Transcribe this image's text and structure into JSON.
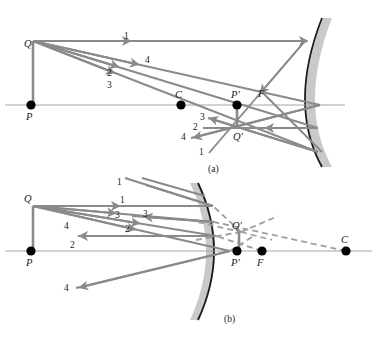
{
  "figure": {
    "colors": {
      "ray": "#8a8a8a",
      "axis": "#9a9a9a",
      "mirror_line": "#1a1a1a",
      "mirror_shade": "#c9c9c9",
      "point": "#000000",
      "label": "#1a1a1a",
      "virtual_ray": "#9e9e9e",
      "background": "#ffffff"
    },
    "panels": [
      {
        "id": "a",
        "caption": "(a)",
        "mirror_type": "concave",
        "points": [
          {
            "name": "P",
            "label": "P",
            "x": 31,
            "y": 105,
            "dot": true
          },
          {
            "name": "Q",
            "label": "Q",
            "x": 33,
            "y": 41,
            "dot": false
          },
          {
            "name": "C",
            "label": "C",
            "x": 181,
            "y": 105,
            "dot": true
          },
          {
            "name": "P'",
            "label": "P'",
            "x": 237,
            "y": 105,
            "dot": true
          },
          {
            "name": "F",
            "label": "F",
            "x": 263,
            "y": 105,
            "dot": false
          },
          {
            "name": "Q'",
            "label": "Q'",
            "x": 239,
            "y": 129,
            "dot": false
          }
        ],
        "ray_labels": [
          {
            "text": "1",
            "x": 124,
            "y": 39,
            "note": "incident parallel ray"
          },
          {
            "text": "4",
            "x": 145,
            "y": 63,
            "note": "incident ray to vertex"
          },
          {
            "text": "2",
            "x": 107,
            "y": 76,
            "note": "incident ray through F"
          },
          {
            "text": "3",
            "x": 107,
            "y": 88,
            "note": "incident ray through C"
          },
          {
            "text": "3",
            "x": 200,
            "y": 117,
            "note": "reflected ray 3"
          },
          {
            "text": "2",
            "x": 195,
            "y": 127,
            "note": "reflected ray 2"
          },
          {
            "text": "4",
            "x": 184,
            "y": 137,
            "note": "reflected ray 4"
          },
          {
            "text": "1",
            "x": 201,
            "y": 152,
            "note": "reflected ray 1"
          }
        ]
      },
      {
        "id": "b",
        "caption": "(b)",
        "mirror_type": "convex",
        "points": [
          {
            "name": "P",
            "label": "P",
            "x": 31,
            "y": 251,
            "dot": true
          },
          {
            "name": "Q",
            "label": "Q",
            "x": 33,
            "y": 206,
            "dot": false
          },
          {
            "name": "P'",
            "label": "P'",
            "x": 237,
            "y": 251,
            "dot": true
          },
          {
            "name": "F",
            "label": "F",
            "x": 262,
            "y": 251,
            "dot": true
          },
          {
            "name": "C",
            "label": "C",
            "x": 346,
            "y": 251,
            "dot": true
          },
          {
            "name": "Q'",
            "label": "Q'",
            "x": 239,
            "y": 232,
            "dot": false
          }
        ],
        "ray_labels": [
          {
            "text": "1",
            "x": 120,
            "y": 203,
            "note": "incident parallel ray"
          },
          {
            "text": "3",
            "x": 117,
            "y": 217,
            "note": "incident ray toward C"
          },
          {
            "text": "3",
            "x": 143,
            "y": 216,
            "note": "reflected ray 3"
          },
          {
            "text": "4",
            "x": 66,
            "y": 227,
            "note": "incident ray to vertex"
          },
          {
            "text": "2",
            "x": 127,
            "y": 229,
            "note": "incident ray toward F"
          },
          {
            "text": "2",
            "x": 72,
            "y": 245,
            "note": "reflected ray 2"
          },
          {
            "text": "4",
            "x": 66,
            "y": 288,
            "note": "reflected ray 4"
          },
          {
            "text": "1",
            "x": 119,
            "y": 183,
            "note": "reflected ray 1 (upper left)"
          }
        ]
      }
    ]
  }
}
